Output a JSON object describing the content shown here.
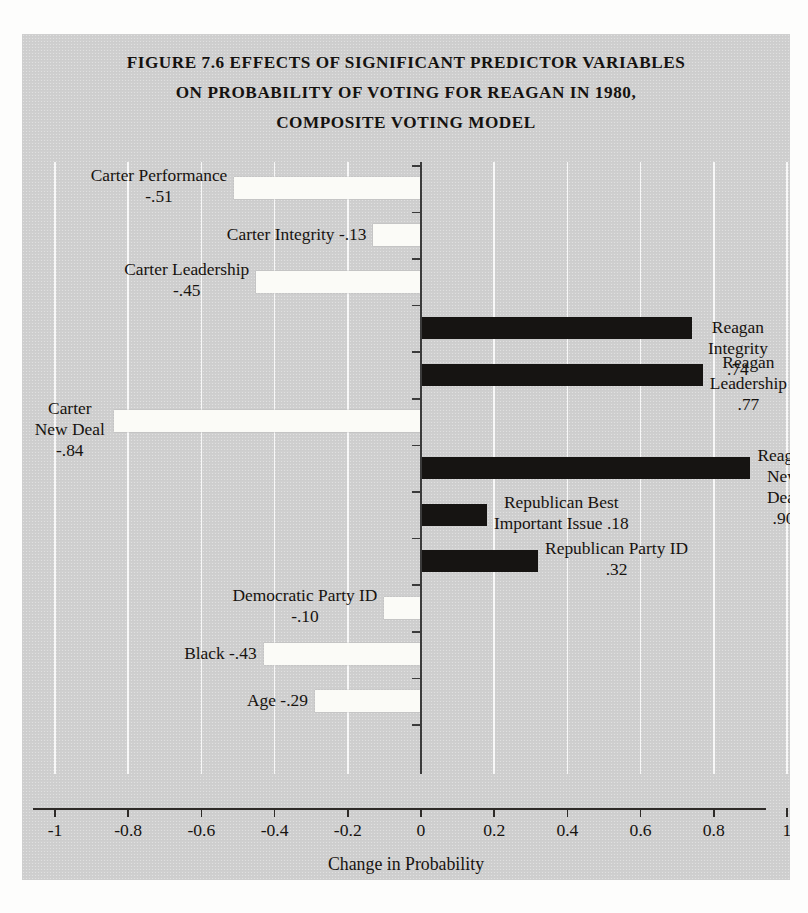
{
  "figure": {
    "title_lines": [
      "FIGURE 7.6 EFFECTS OF SIGNIFICANT PREDICTOR VARIABLES",
      "ON PROBABILITY OF VOTING FOR REAGAN IN 1980,",
      "COMPOSITE VOTING MODEL"
    ],
    "colors": {
      "panel_background": "#cfcfcf",
      "negative_bar": "#fbfbf7",
      "positive_bar": "#161412",
      "axis": "#2e2b28",
      "gridline": "#ffffff",
      "text": "#17130f"
    }
  },
  "chart_data": {
    "type": "bar",
    "orientation": "horizontal",
    "title": "FIGURE 7.6 EFFECTS OF SIGNIFICANT PREDICTOR VARIABLES ON PROBABILITY OF VOTING FOR REAGAN IN 1980, COMPOSITE VOTING MODEL",
    "xlabel": "Change in Probability",
    "ylabel": "",
    "xlim": [
      -1,
      1
    ],
    "grid": true,
    "legend": "none",
    "xticks": [
      -1,
      -0.8,
      -0.6,
      -0.4,
      -0.2,
      0,
      0.2,
      0.4,
      0.6,
      0.8,
      1
    ],
    "xtick_labels": [
      "-1",
      "-0.8",
      "-0.6",
      "-0.4",
      "-0.2",
      "0",
      "0.2",
      "0.4",
      "0.6",
      "0.8",
      "1"
    ],
    "categories": [
      "Carter Performance",
      "Carter Integrity",
      "Carter Leadership",
      "Reagan Integrity",
      "Reagan Leadership",
      "Carter New Deal",
      "Reagan New Deal",
      "Republican Best Important Issue",
      "Republican Party ID",
      "Democratic Party ID",
      "Black",
      "Age"
    ],
    "values": [
      -0.51,
      -0.13,
      -0.45,
      0.74,
      0.77,
      -0.84,
      0.9,
      0.18,
      0.32,
      -0.1,
      -0.43,
      -0.29
    ],
    "value_labels": [
      "-.51",
      "-.13",
      "-.45",
      ".74",
      ".77",
      "-.84",
      ".90",
      ".18",
      ".32",
      "-.10",
      "-.43",
      "-.29"
    ],
    "bars": [
      {
        "slot": 0,
        "label": "Carter Performance\n-.51",
        "value": -0.51,
        "side": "left"
      },
      {
        "slot": 1,
        "label": "Carter Integrity -.13",
        "value": -0.13,
        "side": "left"
      },
      {
        "slot": 2,
        "label": "Carter Leadership\n-.45",
        "value": -0.45,
        "side": "left"
      },
      {
        "slot": 3,
        "label": "Reagan Integrity .74",
        "value": 0.74,
        "side": "right"
      },
      {
        "slot": 4,
        "label": "Reagan Leadership\n.77",
        "value": 0.77,
        "side": "right"
      },
      {
        "slot": 5,
        "label": "Carter New Deal\n-.84",
        "value": -0.84,
        "side": "left"
      },
      {
        "slot": 6,
        "label": "Reagan New Deal\n.90",
        "value": 0.9,
        "side": "right"
      },
      {
        "slot": 7,
        "label": "Republican Best\nImportant Issue .18",
        "value": 0.18,
        "side": "right"
      },
      {
        "slot": 8,
        "label": "Republican Party ID\n.32",
        "value": 0.32,
        "side": "right"
      },
      {
        "slot": 9,
        "label": "Democratic Party ID\n-.10",
        "value": -0.1,
        "side": "left"
      },
      {
        "slot": 10,
        "label": "Black -.43",
        "value": -0.43,
        "side": "left"
      },
      {
        "slot": 11,
        "label": "Age -.29",
        "value": -0.29,
        "side": "left"
      }
    ]
  }
}
